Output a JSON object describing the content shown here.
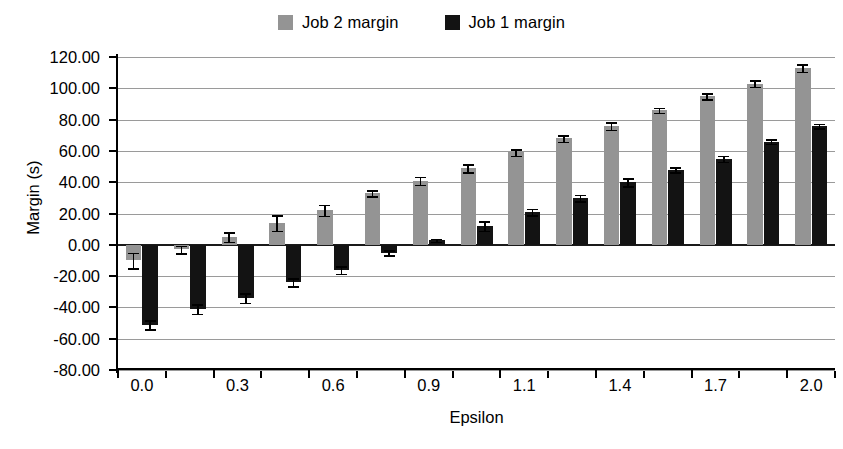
{
  "legend": {
    "items": [
      {
        "label": "Job 2 margin",
        "color": "#949494",
        "icon": "square-swatch-icon"
      },
      {
        "label": "Job 1 margin",
        "color": "#131313",
        "icon": "square-swatch-icon"
      }
    ]
  },
  "axes": {
    "ylabel": "Margin (s)",
    "xlabel": "Epsilon",
    "yticks": [
      "120.00",
      "100.00",
      "80.00",
      "60.00",
      "40.00",
      "20.00",
      "0.00",
      "-20.00",
      "-40.00",
      "-60.00",
      "-80.00"
    ],
    "xticks": [
      "0.0",
      "0.3",
      "0.6",
      "0.9",
      "1.1",
      "1.4",
      "1.7",
      "2.0"
    ]
  },
  "chart_data": {
    "type": "bar",
    "title": "",
    "xlabel": "Epsilon",
    "ylabel": "Margin (s)",
    "ylim": [
      -80,
      120
    ],
    "ytick_values": [
      120,
      100,
      80,
      60,
      40,
      20,
      0,
      -20,
      -40,
      -60,
      -80
    ],
    "grid": true,
    "legend_position": "top-center",
    "categories": [
      "0.0",
      "0.1",
      "0.3",
      "0.4",
      "0.6",
      "0.7",
      "0.9",
      "1.0",
      "1.1",
      "1.3",
      "1.4",
      "1.6",
      "1.7",
      "1.9",
      "2.0"
    ],
    "xtick_labels": [
      "0.0",
      "0.3",
      "0.6",
      "0.9",
      "1.1",
      "1.4",
      "1.7",
      "2.0"
    ],
    "series": [
      {
        "name": "Job 2 margin",
        "color": "#949494",
        "values": [
          -10,
          -3,
          5,
          14,
          22,
          33,
          41,
          49,
          59,
          68,
          76,
          86,
          95,
          103,
          113
        ],
        "errors": [
          5,
          2.5,
          3,
          5,
          3.5,
          2,
          2.5,
          2.5,
          2,
          2,
          2.5,
          1.5,
          2,
          2,
          2.5
        ]
      },
      {
        "name": "Job 1 margin",
        "color": "#131313",
        "values": [
          -51,
          -41,
          -34,
          -24,
          -16,
          -5,
          3,
          12,
          21,
          30,
          40,
          48,
          55,
          66,
          76
        ],
        "errors": [
          3,
          3,
          3,
          2.5,
          2.5,
          1.5,
          1,
          3,
          2,
          2,
          2.5,
          1.5,
          2,
          1.5,
          1.5
        ]
      }
    ]
  }
}
